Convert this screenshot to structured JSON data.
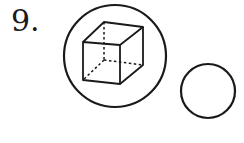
{
  "problem": {
    "number_label": "9."
  },
  "figure": {
    "stroke_color": "#1a1a1a",
    "large_circle": {
      "cx": 115,
      "cy": 56,
      "r": 51,
      "contains": "cube (wireframe with hidden edges dashed)"
    },
    "small_circle": {
      "cx": 208,
      "cy": 91,
      "r": 27,
      "contains": "empty"
    }
  }
}
